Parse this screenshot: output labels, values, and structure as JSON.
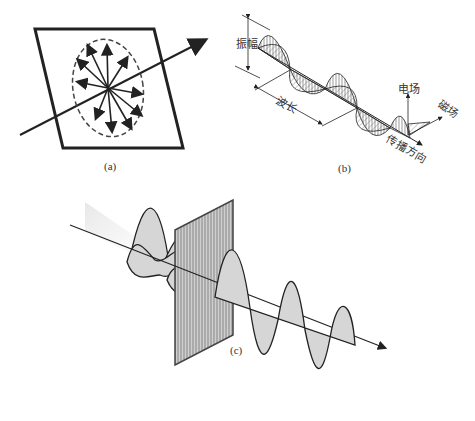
{
  "figure": {
    "panels": [
      {
        "id": "a",
        "caption": "(a)",
        "description": "Unpolarized light: electric field vectors in all directions within a plane perpendicular to propagation"
      },
      {
        "id": "b",
        "caption": "(b)",
        "labels": {
          "amplitude": "振幅",
          "wavelength": "波长",
          "electric_field": "电场",
          "magnetic_field": "磁场",
          "propagation_direction": "传播方向"
        }
      },
      {
        "id": "c",
        "caption": "(c)",
        "description": "Unpolarized light passing through a linear polarizer becomes linearly polarized"
      }
    ]
  },
  "colors": {
    "stroke": "#222222",
    "fill_gray": "#d4d4d4",
    "polarizer_fill": "#bdbdbd"
  }
}
